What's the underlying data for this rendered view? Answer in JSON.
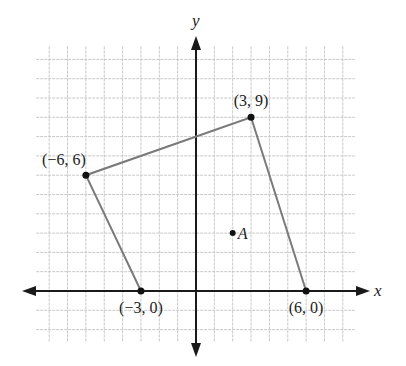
{
  "chart_data": {
    "type": "scatter",
    "title": "",
    "xlabel": "x",
    "ylabel": "y",
    "grid": true,
    "grid_x_range": [
      -8,
      8
    ],
    "grid_y_range": [
      -2,
      12
    ],
    "xlim": [
      -9,
      9.5
    ],
    "ylim": [
      -3.4,
      13.2
    ],
    "polygon": {
      "name": "quadrilateral",
      "closed": false,
      "vertices": [
        {
          "x": -3,
          "y": 0,
          "label": "(−3, 0)"
        },
        {
          "x": -6,
          "y": 6,
          "label": "(−6, 6)"
        },
        {
          "x": 3,
          "y": 9,
          "label": "(3, 9)"
        },
        {
          "x": 6,
          "y": 0,
          "label": "(6, 0)"
        }
      ]
    },
    "points": [
      {
        "x": 2,
        "y": 3,
        "label": "A"
      }
    ]
  },
  "colors": {
    "axis": "#1a1a1a",
    "grid": "#c8c8c8",
    "polygon": "#7a7a7a",
    "point": "#111111"
  }
}
